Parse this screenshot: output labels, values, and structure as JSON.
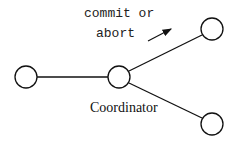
{
  "diagram": {
    "message_line1": "commit or",
    "message_line2": "abort",
    "coordinator_label": "Coordinator",
    "nodes": [
      {
        "id": "participant-left",
        "cx": 26,
        "cy": 77,
        "r": 11
      },
      {
        "id": "coordinator",
        "cx": 119,
        "cy": 77,
        "r": 11
      },
      {
        "id": "participant-top-right",
        "cx": 212,
        "cy": 29,
        "r": 11
      },
      {
        "id": "participant-bottom-right",
        "cx": 212,
        "cy": 124,
        "r": 11
      }
    ],
    "colors": {
      "stroke": "#111111",
      "background": "#ffffff"
    }
  }
}
